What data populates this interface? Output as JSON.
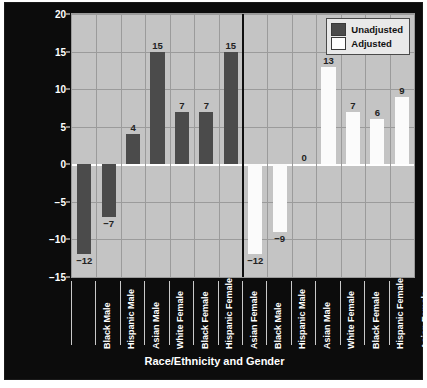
{
  "chart_data": {
    "type": "bar",
    "title": "",
    "xlabel": "Race/Ethnicity and Gender",
    "ylabel_line1": "Differences in Rate of Finishing on Time Compared to",
    "ylabel_line2": "White Males (Percentage Points)",
    "ylim": [
      -15,
      20
    ],
    "yticks": [
      20,
      15,
      10,
      5,
      0,
      -5,
      -10,
      -15
    ],
    "ytick_labels": [
      "20",
      "15",
      "10",
      "5",
      "0",
      "−5",
      "−10",
      "−15"
    ],
    "grid": true,
    "legend_position": "top-right",
    "legend": [
      {
        "name": "Unadjusted",
        "color": "#4b4b4b"
      },
      {
        "name": "Adjusted",
        "color": "#ffffff"
      }
    ],
    "categories": [
      "Black Male",
      "Hispanic Male",
      "Asian Male",
      "White Female",
      "Black Female",
      "Hispanic Female",
      "Asian Female"
    ],
    "series": [
      {
        "name": "Unadjusted",
        "color": "#4b4b4b",
        "values": [
          -12,
          -7,
          4,
          15,
          7,
          7,
          15
        ],
        "labels": [
          "−12",
          "−7",
          "4",
          "15",
          "7",
          "7",
          "15"
        ]
      },
      {
        "name": "Adjusted",
        "color": "#ffffff",
        "values": [
          -12,
          -9,
          0,
          13,
          7,
          6,
          9
        ],
        "labels": [
          "−12",
          "−9",
          "0",
          "13",
          "7",
          "6",
          "9"
        ]
      }
    ],
    "group_divider": true
  },
  "colors": {
    "figure_background": "#0c0c0c",
    "plot_background": "#c4c4c4",
    "gridline": "#9b9b9b",
    "zero_line": "#ffffff",
    "unadjusted_bar": "#4b4b4b",
    "adjusted_bar": "#fbfbfb",
    "text_light": "#ffffff",
    "value_label": "#222222"
  }
}
